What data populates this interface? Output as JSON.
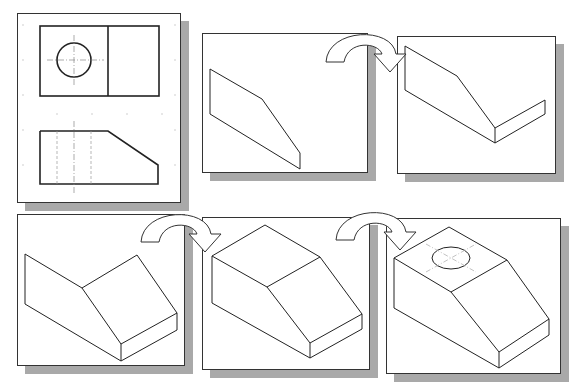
{
  "figure": {
    "type": "orthographic-to-isometric-construction",
    "steps_count": 6
  },
  "panels": [
    {
      "id": "step-1",
      "label": "Orthographic views (top and front)",
      "views": [
        "top-view",
        "front-view"
      ]
    },
    {
      "id": "step-2",
      "label": "Front face projected isometrically"
    },
    {
      "id": "step-3",
      "label": "Depth edges added"
    },
    {
      "id": "step-4",
      "label": "Sloped and side faces"
    },
    {
      "id": "step-5",
      "label": "Complete block with top face"
    },
    {
      "id": "step-6",
      "label": "Circle feature drawn as isometric ellipse on top face"
    }
  ],
  "arrows": [
    {
      "from": "step-2",
      "to": "step-3",
      "icon": "curved-arrow-icon"
    },
    {
      "from": "step-4",
      "to": "step-5",
      "icon": "curved-arrow-icon"
    },
    {
      "from": "step-5",
      "to": "step-6",
      "icon": "curved-arrow-icon"
    }
  ],
  "colors": {
    "line": "#222222",
    "hidden_line": "#888888",
    "shadow": "#a9a9a9",
    "grid_dot": "#c8c8c8",
    "background": "#ffffff"
  }
}
